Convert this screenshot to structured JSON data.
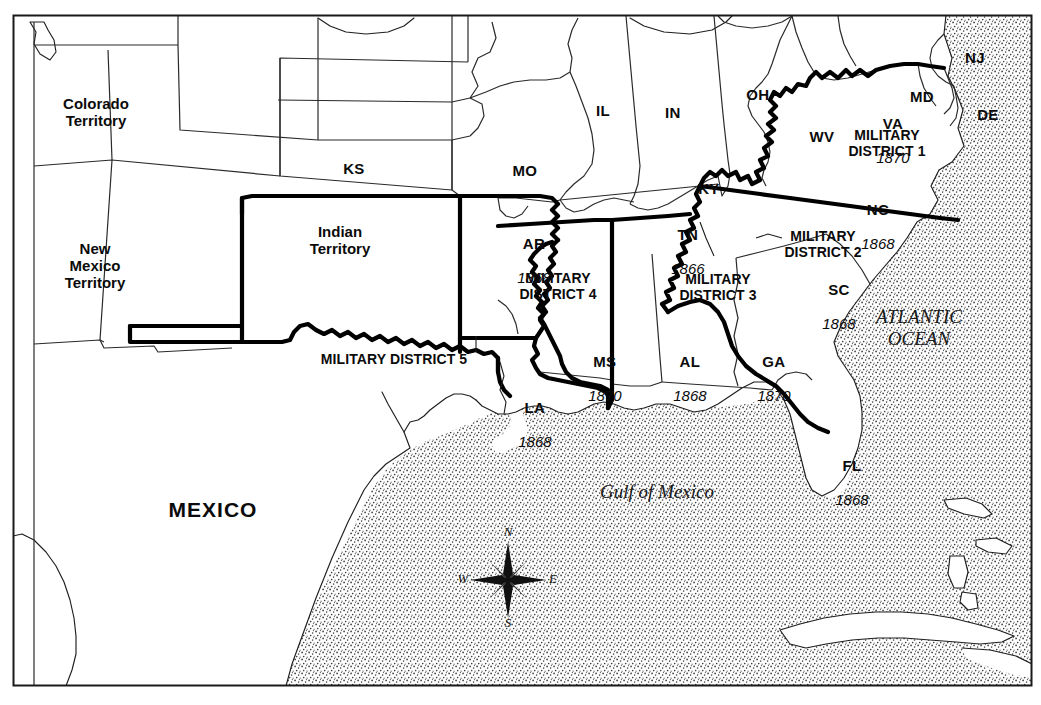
{
  "map": {
    "title": "Reconstruction Military Districts of the Southern United States",
    "frame": {
      "stroke": "#1a1a1a"
    },
    "colors": {
      "land": "#ffffff",
      "ink": "#0b0b0b",
      "state_border": "#2b2b2b",
      "district_border": "#000000",
      "ocean_stipple": "#3a3a3a"
    }
  },
  "territories": [
    {
      "name": "colorado-territory",
      "label": "Colorado\nTerritory",
      "x": 96,
      "y": 96
    },
    {
      "name": "new-mexico-territory",
      "label": "New\nMexico\nTerritory",
      "x": 95,
      "y": 241
    },
    {
      "name": "indian-territory",
      "label": "Indian\nTerritory",
      "x": 340,
      "y": 224
    }
  ],
  "states": [
    {
      "name": "kansas",
      "abbr": "KS",
      "year": "",
      "x": 345,
      "y": 144
    },
    {
      "name": "missouri",
      "abbr": "MO",
      "year": "",
      "x": 516,
      "y": 146
    },
    {
      "name": "illinois",
      "abbr": "IL",
      "year": "",
      "x": 594,
      "y": 86
    },
    {
      "name": "indiana",
      "abbr": "IN",
      "year": "",
      "x": 664,
      "y": 88
    },
    {
      "name": "ohio",
      "abbr": "OH",
      "year": "",
      "x": 749,
      "y": 70
    },
    {
      "name": "west-virginia",
      "abbr": "WV",
      "year": "",
      "x": 813,
      "y": 112
    },
    {
      "name": "maryland",
      "abbr": "MD",
      "year": "",
      "x": 913,
      "y": 72
    },
    {
      "name": "new-jersey",
      "abbr": "NJ",
      "year": "",
      "x": 966,
      "y": 33
    },
    {
      "name": "delaware",
      "abbr": "DE",
      "year": "",
      "x": 979,
      "y": 90
    },
    {
      "name": "virginia",
      "abbr": "VA",
      "year": "1870",
      "x": 884,
      "y": 99
    },
    {
      "name": "kentucky",
      "abbr": "KY",
      "year": "",
      "x": 700,
      "y": 164
    },
    {
      "name": "tennessee",
      "abbr": "TN",
      "year": "1866",
      "x": 679,
      "y": 210
    },
    {
      "name": "north-carolina",
      "abbr": "NC",
      "year": "1868",
      "x": 869,
      "y": 185
    },
    {
      "name": "south-carolina",
      "abbr": "SC",
      "year": "1868",
      "x": 830,
      "y": 265
    },
    {
      "name": "arkansas",
      "abbr": "AR",
      "year": "1868",
      "x": 525,
      "y": 219
    },
    {
      "name": "mississippi",
      "abbr": "MS",
      "year": "1870",
      "x": 596,
      "y": 337
    },
    {
      "name": "louisiana",
      "abbr": "LA",
      "year": "1868",
      "x": 526,
      "y": 383
    },
    {
      "name": "alabama",
      "abbr": "AL",
      "year": "1868",
      "x": 681,
      "y": 337
    },
    {
      "name": "georgia",
      "abbr": "GA",
      "year": "1870",
      "x": 765,
      "y": 337
    },
    {
      "name": "florida",
      "abbr": "FL",
      "year": "1868",
      "x": 843,
      "y": 441
    }
  ],
  "districts": [
    {
      "name": "military-district-1",
      "label": "MILITARY\nDISTRICT 1",
      "x": 887,
      "y": 128,
      "leader": false
    },
    {
      "name": "military-district-2",
      "label": "MILITARY\nDISTRICT 2",
      "x": 823,
      "y": 229,
      "leader": true
    },
    {
      "name": "military-district-3",
      "label": "MILITARY\nDISTRICT 3",
      "x": 718,
      "y": 272,
      "leader": true
    },
    {
      "name": "military-district-4",
      "label": "MILITARY\nDISTRICT 4",
      "x": 558,
      "y": 271,
      "leader": false
    },
    {
      "name": "military-district-5",
      "label": "MILITARY DISTRICT 5",
      "x": 394,
      "y": 352,
      "leader": true
    }
  ],
  "countries": [
    {
      "name": "mexico",
      "label": "MEXICO",
      "x": 213,
      "y": 509
    }
  ],
  "waters": [
    {
      "name": "gulf-of-mexico",
      "label": "Gulf of Mexico",
      "x": 657,
      "y": 490
    },
    {
      "name": "atlantic-ocean",
      "label": "ATLANTIC\nOCEAN",
      "x": 919,
      "y": 322
    }
  ],
  "compass": {
    "name": "compass-rose",
    "cx": 508,
    "cy": 580,
    "north": "N",
    "south": "S",
    "east": "E",
    "west": "W"
  }
}
